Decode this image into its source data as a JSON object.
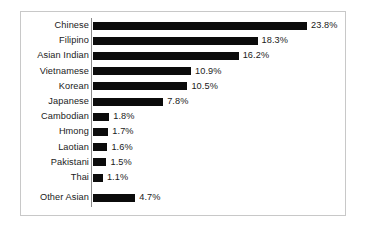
{
  "chart_data": {
    "type": "bar",
    "orientation": "horizontal",
    "title": "",
    "subtitle": "",
    "xlabel": "",
    "ylabel": "",
    "grid": false,
    "legend": false,
    "axis_visible": true,
    "value_suffix": "%",
    "xlim": [
      0,
      23.8
    ],
    "categories": [
      "Chinese",
      "Filipino",
      "Asian Indian",
      "Vietnamese",
      "Korean",
      "Japanese",
      "Cambodian",
      "Hmong",
      "Laotian",
      "Pakistani",
      "Thai",
      "Other Asian"
    ],
    "values": [
      23.8,
      18.3,
      16.2,
      10.9,
      10.5,
      7.8,
      1.8,
      1.7,
      1.6,
      1.5,
      1.1,
      4.7
    ],
    "value_labels": [
      "23.8%",
      "18.3%",
      "16.2%",
      "10.9%",
      "10.5%",
      "7.8%",
      "1.8%",
      "1.7%",
      "1.6%",
      "1.5%",
      "1.1%",
      "4.7%"
    ],
    "bar_color": "#0b0b0b",
    "border_color": "#c8c8c8",
    "background_color": "#ffffff"
  }
}
